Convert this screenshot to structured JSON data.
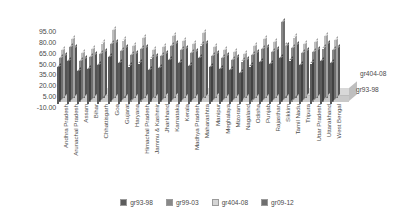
{
  "chart_data": {
    "type": "bar",
    "title": "",
    "subtitle": "",
    "xlabel": "",
    "ylabel": "",
    "ylim": [
      -10,
      95
    ],
    "yticks": [
      "95.00",
      "80.00",
      "65.00",
      "50.00",
      "35.00",
      "20.00",
      "5.00",
      "-10.00"
    ],
    "ytick_values": [
      95,
      80,
      65,
      50,
      35,
      20,
      5,
      -10
    ],
    "grid": false,
    "legend_position": "bottom",
    "style": "3d-clustered-column-grayscale",
    "categories": [
      "Andhra Pradesh",
      "Arunachal Pradesh",
      "Assam",
      "Bihar",
      "Chhattisgarh",
      "Goa",
      "Gujarat",
      "Haryana",
      "Himachal Pradesh",
      "Jammu & Kashmir",
      "Jharkhand",
      "Karnataka",
      "Kerala",
      "Madhya Pradesh",
      "Maharashtra",
      "Manipur",
      "Meghalaya",
      "Mizoram",
      "Nagaland",
      "Odisha",
      "Punjab",
      "Rajasthan",
      "Sikkim",
      "Tamil Nadu",
      "Tripura",
      "Uttar Pradesh",
      "Uttarakhand",
      "West Bengal"
    ],
    "series": [
      {
        "name": "gr93-98",
        "color": "#5c5c5c",
        "values": [
          38,
          46,
          33,
          36,
          41,
          52,
          44,
          39,
          43,
          35,
          37,
          48,
          44,
          40,
          50,
          38,
          36,
          34,
          31,
          39,
          45,
          42,
          50,
          47,
          41,
          43,
          46,
          44
        ]
      },
      {
        "name": "gr99-03",
        "color": "#888888",
        "values": [
          48,
          62,
          44,
          49,
          53,
          66,
          57,
          52,
          59,
          47,
          50,
          63,
          58,
          54,
          64,
          50,
          48,
          45,
          43,
          52,
          59,
          56,
          95,
          61,
          54,
          56,
          60,
          58
        ]
      },
      {
        "name": "gr404-08",
        "color": "#bdbdbd",
        "values": [
          56,
          70,
          52,
          57,
          64,
          82,
          68,
          61,
          71,
          55,
          59,
          74,
          67,
          63,
          78,
          59,
          56,
          53,
          50,
          61,
          70,
          66,
          60,
          72,
          63,
          66,
          74,
          69
        ]
      },
      {
        "name": "gr09-12",
        "color": "#6e6e6e",
        "values": [
          45,
          55,
          41,
          46,
          50,
          62,
          55,
          48,
          56,
          44,
          47,
          60,
          54,
          50,
          61,
          47,
          45,
          42,
          40,
          49,
          56,
          53,
          58,
          59,
          51,
          53,
          60,
          56
        ]
      }
    ],
    "annotations": [
      {
        "text": "gr404-08",
        "name": "series-callout-gr404-08"
      },
      {
        "text": "gr93-98",
        "name": "series-callout-gr93-98"
      }
    ]
  },
  "legend": {
    "items": [
      {
        "label": "gr93-98",
        "color": "#5c5c5c"
      },
      {
        "label": "gr99-03",
        "color": "#888888"
      },
      {
        "label": "gr404-08",
        "color": "#d5d5d5"
      },
      {
        "label": "gr09-12",
        "color": "#6e6e6e"
      }
    ]
  }
}
